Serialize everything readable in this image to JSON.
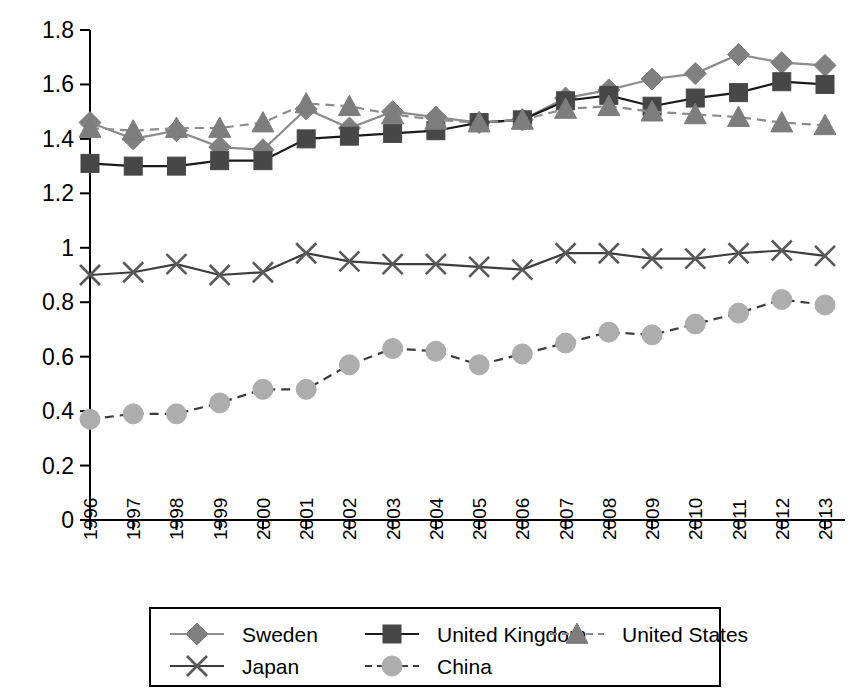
{
  "chart_data": {
    "type": "line",
    "title": "",
    "subtitle": "",
    "xlabel": "",
    "ylabel": "",
    "grid": false,
    "legend_position": "bottom",
    "x": [
      "1996",
      "1997",
      "1998",
      "1999",
      "2000",
      "2001",
      "2002",
      "2003",
      "2004",
      "2005",
      "2006",
      "2007",
      "2008",
      "2009",
      "2010",
      "2011",
      "2012",
      "2013"
    ],
    "categories": [
      "1996",
      "1997",
      "1998",
      "1999",
      "2000",
      "2001",
      "2002",
      "2003",
      "2004",
      "2005",
      "2006",
      "2007",
      "2008",
      "2009",
      "2010",
      "2011",
      "2012",
      "2013"
    ],
    "ylim": [
      0,
      1.8
    ],
    "ytick_labels": [
      "0",
      "0.2",
      "0.4",
      "0.6",
      "0.8",
      "1",
      "1.2",
      "1.4",
      "1.6",
      "1.8"
    ],
    "ytick_values": [
      0,
      0.2,
      0.4,
      0.6,
      0.8,
      1.0,
      1.2,
      1.4,
      1.6,
      1.8
    ],
    "series": [
      {
        "name": "Sweden",
        "marker": "diamond",
        "line_style": "solid",
        "color": "#808080",
        "line_color": "#8c8c8c",
        "values": [
          1.46,
          1.4,
          1.43,
          1.37,
          1.36,
          1.51,
          1.44,
          1.5,
          1.48,
          1.46,
          1.47,
          1.55,
          1.58,
          1.62,
          1.64,
          1.71,
          1.68,
          1.67
        ]
      },
      {
        "name": "United Kingdom",
        "marker": "square",
        "line_style": "solid",
        "color": "#474747",
        "line_color": "#1a1a1a",
        "values": [
          1.31,
          1.3,
          1.3,
          1.32,
          1.32,
          1.4,
          1.41,
          1.42,
          1.43,
          1.46,
          1.47,
          1.54,
          1.56,
          1.52,
          1.55,
          1.57,
          1.61,
          1.6
        ]
      },
      {
        "name": "United States",
        "marker": "triangle",
        "line_style": "dashed",
        "color": "#7d7d7d",
        "line_color": "#8c8c8c",
        "values": [
          1.44,
          1.43,
          1.44,
          1.44,
          1.46,
          1.53,
          1.52,
          1.49,
          1.47,
          1.46,
          1.47,
          1.51,
          1.52,
          1.5,
          1.49,
          1.48,
          1.46,
          1.45
        ]
      },
      {
        "name": "Japan",
        "marker": "x",
        "line_style": "solid",
        "color": "#595959",
        "line_color": "#3d3d3d",
        "values": [
          0.9,
          0.91,
          0.94,
          0.9,
          0.91,
          0.98,
          0.95,
          0.94,
          0.94,
          0.93,
          0.92,
          0.98,
          0.98,
          0.96,
          0.96,
          0.98,
          0.99,
          0.97
        ]
      },
      {
        "name": "China",
        "marker": "circle",
        "line_style": "dashed",
        "color": "#adadad",
        "line_color": "#3d3d3d",
        "values": [
          0.37,
          0.39,
          0.39,
          0.43,
          0.48,
          0.48,
          0.57,
          0.63,
          0.62,
          0.57,
          0.61,
          0.65,
          0.69,
          0.68,
          0.72,
          0.76,
          0.81,
          0.79
        ]
      }
    ]
  },
  "legend": {
    "items": [
      {
        "label": "Sweden"
      },
      {
        "label": "United Kingdom"
      },
      {
        "label": "United States"
      },
      {
        "label": "Japan"
      },
      {
        "label": "China"
      }
    ]
  }
}
